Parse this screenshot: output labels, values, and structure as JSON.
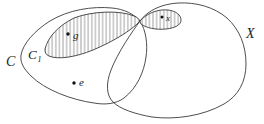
{
  "figure": {
    "background_color": "#ffffff",
    "line_color": "#3a3a3a",
    "label_color": "#1c1c1c",
    "hatch_color": "#4a4a4a",
    "sets": {
      "c_label": "C",
      "c1_label_base": "C",
      "c1_label_sub": "1",
      "x_label": "X"
    },
    "points": {
      "g_label": "g",
      "e_label": "e",
      "x_label": "x"
    }
  }
}
